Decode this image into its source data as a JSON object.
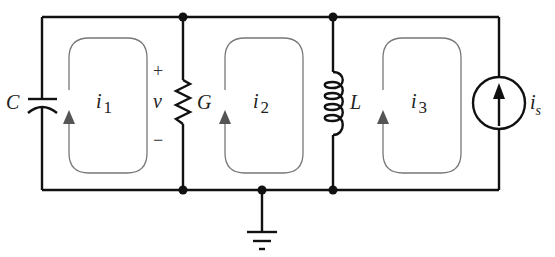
{
  "diagram": {
    "type": "circuit-schematic",
    "colors": {
      "wire": "#111111",
      "loop": "#777777",
      "arrow": "#555555",
      "background": "#ffffff"
    },
    "components": {
      "capacitor": {
        "label": "C"
      },
      "conductance": {
        "label": "G"
      },
      "inductor": {
        "label": "L"
      },
      "current_source": {
        "label_main": "i",
        "label_sub": "s"
      }
    },
    "voltage": {
      "plus": "+",
      "label": "v",
      "minus": "−"
    },
    "mesh_currents": [
      {
        "label_main": "i",
        "label_sub": "1"
      },
      {
        "label_main": "i",
        "label_sub": "2"
      },
      {
        "label_main": "i",
        "label_sub": "3"
      }
    ],
    "ground": {
      "name": "ground"
    }
  }
}
